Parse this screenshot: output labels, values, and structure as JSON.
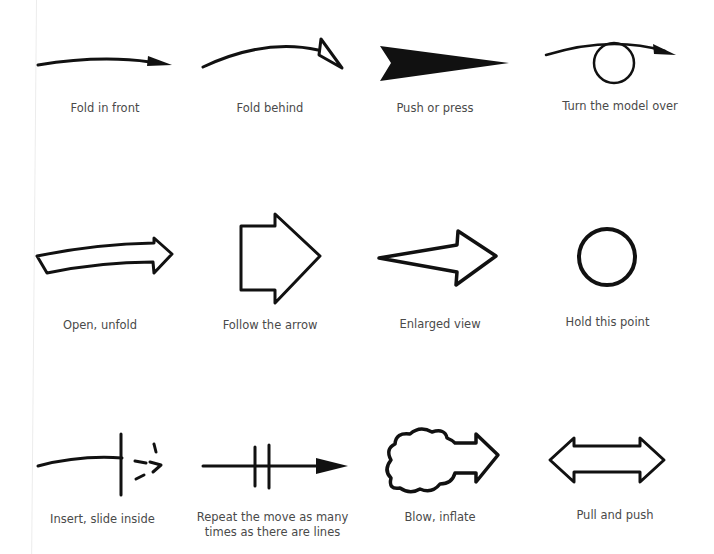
{
  "colors": {
    "ink": "#111111",
    "label": "#4a4a4a",
    "background": "#ffffff"
  },
  "symbols": [
    {
      "icon": "fold-in-front-arrow-icon",
      "label": "Fold in front"
    },
    {
      "icon": "fold-behind-arrow-icon",
      "label": "Fold behind"
    },
    {
      "icon": "push-press-arrow-icon",
      "label": "Push or press"
    },
    {
      "icon": "turn-model-over-arrow-icon",
      "label": "Turn the model over"
    },
    {
      "icon": "open-unfold-arrow-icon",
      "label": "Open, unfold"
    },
    {
      "icon": "follow-arrow-icon",
      "label": "Follow the arrow"
    },
    {
      "icon": "enlarged-view-arrow-icon",
      "label": "Enlarged view"
    },
    {
      "icon": "hold-point-circle-icon",
      "label": "Hold this point"
    },
    {
      "icon": "insert-slide-inside-icon",
      "label": "Insert, slide inside"
    },
    {
      "icon": "repeat-move-arrow-icon",
      "label": "Repeat the move as many times as there are lines"
    },
    {
      "icon": "blow-inflate-cloud-arrow-icon",
      "label": "Blow, inflate"
    },
    {
      "icon": "pull-push-double-arrow-icon",
      "label": "Pull and push"
    }
  ]
}
